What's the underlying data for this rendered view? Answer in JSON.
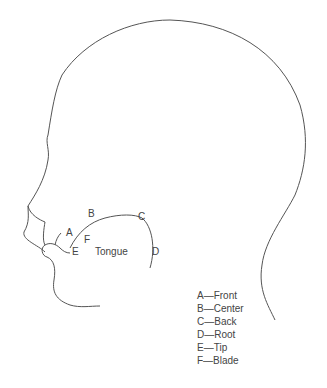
{
  "diagram": {
    "tongue_label": "Tongue",
    "point_labels": {
      "A": "A",
      "B": "B",
      "C": "C",
      "D": "D",
      "E": "E",
      "F": "F"
    },
    "line_color": "#555555"
  },
  "legend": {
    "items": [
      {
        "letter": "A",
        "dash": "—",
        "name": "Front"
      },
      {
        "letter": "B",
        "dash": "—",
        "name": "Center"
      },
      {
        "letter": "C",
        "dash": "—",
        "name": "Back"
      },
      {
        "letter": "D",
        "dash": "—",
        "name": "Root"
      },
      {
        "letter": "E",
        "dash": "—",
        "name": "Tip"
      },
      {
        "letter": "F",
        "dash": "—",
        "name": "Blade"
      }
    ]
  }
}
